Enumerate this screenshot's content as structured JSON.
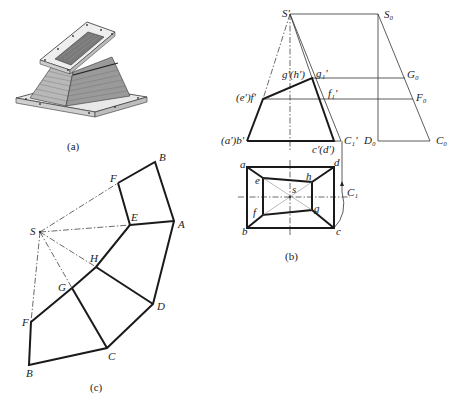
{
  "figure": {
    "panels": [
      {
        "id": "a",
        "caption": "(a)",
        "content": "3D rendering of a transition duct: oblique rectangular pyramid frustum with flanged top and bottom"
      },
      {
        "id": "b",
        "caption": "(b)",
        "content": "Front and top orthographic projections with true-length construction"
      },
      {
        "id": "c",
        "caption": "(c)",
        "content": "Flat development (unfolded pattern) of the lateral surface"
      }
    ]
  },
  "panel_b": {
    "caption": "(b)",
    "front_labels": {
      "S_prime": "S'",
      "S0": "S₀",
      "g_h": "g'(h')",
      "g1": "g₁'",
      "G0": "G₀",
      "e_f": "(e')f'",
      "f1": "f₁'",
      "F0": "F₀",
      "a_b": "(a')b'",
      "c_d": "c'(d')",
      "C1_prime": "C₁'",
      "D0": "D₀",
      "C0": "C₀"
    },
    "top_labels": {
      "a": "a",
      "b": "b",
      "c": "c",
      "d": "d",
      "e": "e",
      "f": "f",
      "g": "g",
      "h": "h",
      "s": "s",
      "C1": "C₁"
    }
  },
  "panel_c": {
    "caption": "(c)",
    "labels": {
      "S": "S",
      "F_top": "F",
      "B_top": "B",
      "E": "E",
      "A": "A",
      "H": "H",
      "G": "G",
      "D": "D",
      "F_bottom": "F",
      "C": "C",
      "B_bottom": "B"
    }
  },
  "panel_a": {
    "caption": "(a)"
  }
}
